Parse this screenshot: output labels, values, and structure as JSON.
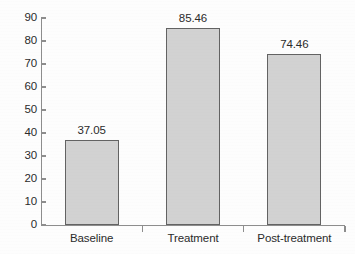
{
  "chart_data": {
    "type": "bar",
    "title": "",
    "subtitle": "",
    "xlabel": "",
    "ylabel": "",
    "categories": [
      "Baseline",
      "Treatment",
      "Post-treatment"
    ],
    "values": [
      37.05,
      85.46,
      74.46
    ],
    "data_labels": [
      "37.05",
      "85.46",
      "74.46"
    ],
    "ylim": [
      0,
      90
    ],
    "ytick_step": 10,
    "ytick_labels": [
      "0",
      "10",
      "20",
      "30",
      "40",
      "50",
      "60",
      "70",
      "80",
      "90"
    ],
    "ytick_values": [
      0,
      10,
      20,
      30,
      40,
      50,
      60,
      70,
      80,
      90
    ],
    "grid": false,
    "legend": null,
    "legend_position": "none",
    "annotations": [],
    "series": [
      {
        "name": "",
        "values": [
          37.05,
          85.46,
          74.46
        ]
      }
    ]
  },
  "style": {
    "bar_fill": "#d2d2d2",
    "bar_border": "#636363",
    "axis_color": "#8d8d8d",
    "text_color": "#2b2b2b",
    "background": "#fdfdfd"
  }
}
